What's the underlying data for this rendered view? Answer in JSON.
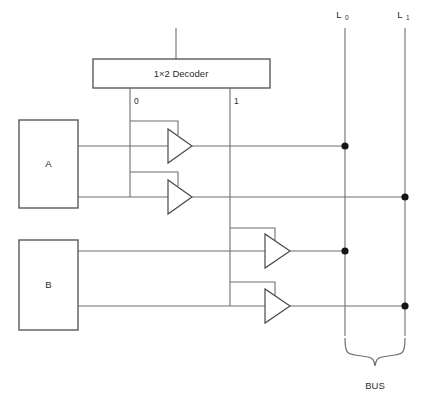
{
  "diagram": {
    "title": "",
    "type": "digital-logic-circuit",
    "decoder": {
      "label": "1×2 Decoder",
      "outputs": [
        {
          "name": "decoder-output-0",
          "label": "0"
        },
        {
          "name": "decoder-output-1",
          "label": "1"
        }
      ]
    },
    "sources": [
      {
        "name": "register-a",
        "label": "A"
      },
      {
        "name": "register-b",
        "label": "B"
      }
    ],
    "bus_lines": [
      {
        "name": "bus-line-l0",
        "label": "L",
        "subscript": "0"
      },
      {
        "name": "bus-line-l1",
        "label": "L",
        "subscript": "1"
      }
    ],
    "bus_bracket": {
      "name": "bus-bracket",
      "label": "BUS"
    },
    "buffers": [
      {
        "name": "buffer-a-to-l0",
        "enable_from": "0",
        "source": "A",
        "target": "L0"
      },
      {
        "name": "buffer-a-to-l1",
        "enable_from": "0",
        "source": "A",
        "target": "L1"
      },
      {
        "name": "buffer-b-to-l0",
        "enable_from": "1",
        "source": "B",
        "target": "L0"
      },
      {
        "name": "buffer-b-to-l1",
        "enable_from": "1",
        "source": "B",
        "target": "L1"
      }
    ],
    "colors": {
      "wire": "#6e6e6e",
      "outline": "#5a5a5a",
      "junction": "#151515",
      "text": "#2b2b2b",
      "background": "#ffffff"
    }
  }
}
